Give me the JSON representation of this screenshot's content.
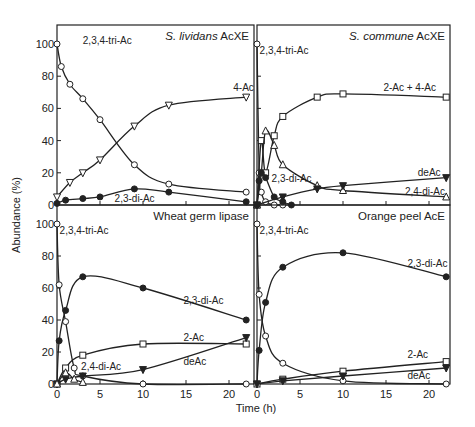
{
  "figure": {
    "ylabel": "Abundance (%)",
    "xlabel": "Time (h)"
  },
  "chart_data": [
    {
      "type": "line",
      "title": "S. lividans AcXE",
      "title_italic": "S. lividans",
      "title_rest": " AcXE",
      "xlabel": "Time (h)",
      "ylabel": "Abundance (%)",
      "xlim": [
        0,
        23
      ],
      "ylim": [
        0,
        105
      ],
      "yticks": [
        0,
        20,
        40,
        60,
        80,
        100
      ],
      "series": [
        {
          "name": "2,3,4-tri-Ac",
          "marker": "circle-open",
          "x": [
            0,
            0.5,
            1.5,
            3,
            5,
            9,
            13,
            22
          ],
          "y": [
            100,
            86,
            75,
            66,
            53,
            25,
            13,
            8
          ]
        },
        {
          "name": "4-Ac",
          "marker": "triangle-down-open",
          "x": [
            0,
            1.5,
            3,
            5,
            9,
            13,
            22
          ],
          "y": [
            5,
            14,
            20,
            28,
            49,
            62,
            67
          ]
        },
        {
          "name": "2,3-di-Ac",
          "marker": "circle-filled",
          "x": [
            0,
            1,
            3,
            5,
            9,
            13,
            22
          ],
          "y": [
            1,
            3,
            4,
            5,
            10,
            8,
            2
          ]
        }
      ]
    },
    {
      "type": "line",
      "title": "S. commune AcXE",
      "title_italic": "S. commune",
      "title_rest": " AcXE",
      "xlim": [
        0,
        23
      ],
      "ylim": [
        0,
        105
      ],
      "series": [
        {
          "name": "2,3,4-tri-Ac",
          "marker": "circle-open",
          "x": [
            0,
            0.25,
            0.5,
            1,
            2,
            3
          ],
          "y": [
            100,
            20,
            8,
            2,
            0,
            0
          ]
        },
        {
          "name": "2-Ac + 4-Ac",
          "marker": "square-open",
          "x": [
            0,
            0.5,
            1,
            2,
            3,
            7,
            10,
            22
          ],
          "y": [
            0,
            40,
            20,
            43,
            55,
            67,
            69,
            67
          ]
        },
        {
          "name": "2,4-di-Ac",
          "marker": "triangle-up-open",
          "x": [
            0,
            0.5,
            1,
            2,
            3,
            7,
            10,
            22
          ],
          "y": [
            0,
            20,
            46,
            37,
            25,
            12,
            9,
            5
          ]
        },
        {
          "name": "deAc",
          "marker": "triangle-down-filled",
          "x": [
            0,
            3,
            7,
            10,
            22
          ],
          "y": [
            0,
            5,
            10,
            12,
            17
          ]
        },
        {
          "name": "2,3-di-Ac",
          "marker": "circle-filled",
          "x": [
            0,
            0.25,
            0.5,
            1,
            2,
            3,
            4
          ],
          "y": [
            0,
            15,
            20,
            17,
            5,
            2,
            0
          ]
        }
      ]
    },
    {
      "type": "line",
      "title": "Wheat germ lipase",
      "title_italic": "",
      "title_rest": "Wheat germ lipase",
      "xticks": [
        0,
        5,
        10,
        15,
        20
      ],
      "xlim": [
        0,
        23
      ],
      "ylim": [
        0,
        105
      ],
      "yticks": [
        0,
        20,
        40,
        60,
        80,
        100
      ],
      "series": [
        {
          "name": "2,3,4-tri-Ac",
          "marker": "circle-open",
          "x": [
            0,
            0.25,
            1,
            2,
            3,
            10,
            22
          ],
          "y": [
            100,
            62,
            39,
            10,
            5,
            0,
            0
          ]
        },
        {
          "name": "2,3-di-Ac",
          "marker": "circle-filled",
          "x": [
            0,
            0.25,
            1,
            3,
            10,
            22
          ],
          "y": [
            0,
            27,
            46,
            67,
            60,
            40
          ]
        },
        {
          "name": "2-Ac",
          "marker": "square-open",
          "x": [
            0,
            1,
            3,
            10,
            22
          ],
          "y": [
            0,
            10,
            18,
            25,
            25
          ]
        },
        {
          "name": "deAc",
          "marker": "triangle-down-filled",
          "x": [
            0,
            1,
            3,
            10,
            22
          ],
          "y": [
            0,
            3,
            5,
            9,
            29
          ]
        },
        {
          "name": "2,4-di-Ac",
          "marker": "triangle-up-open",
          "x": [
            0,
            1,
            2,
            3
          ],
          "y": [
            0,
            7,
            3,
            1
          ]
        }
      ]
    },
    {
      "type": "line",
      "title": "Orange peel AcE",
      "title_italic": "",
      "title_rest": "Orange peel AcE",
      "xticks": [
        0,
        5,
        10,
        15,
        20
      ],
      "xlim": [
        0,
        23
      ],
      "ylim": [
        0,
        105
      ],
      "series": [
        {
          "name": "2,3,4-tri-Ac",
          "marker": "circle-open",
          "x": [
            0,
            0.25,
            1,
            3,
            10,
            22
          ],
          "y": [
            100,
            56,
            30,
            13,
            2,
            0
          ]
        },
        {
          "name": "2,3-di-Ac",
          "marker": "circle-filled",
          "x": [
            0,
            0.25,
            1,
            3,
            10,
            22
          ],
          "y": [
            0,
            21,
            51,
            73,
            82,
            67
          ]
        },
        {
          "name": "2-Ac",
          "marker": "square-open",
          "x": [
            0,
            3,
            10,
            22
          ],
          "y": [
            0,
            3,
            8,
            14
          ]
        },
        {
          "name": "deAc",
          "marker": "triangle-down-filled",
          "x": [
            0,
            3,
            10,
            22
          ],
          "y": [
            0,
            2,
            5,
            10
          ]
        }
      ]
    }
  ],
  "labels": {
    "p0": [
      {
        "text": "2,3,4-tri-Ac",
        "x": 3,
        "y": 100
      },
      {
        "text": "4-Ac",
        "x": 20.5,
        "y": 71
      },
      {
        "text": "2,3-di-Ac",
        "x": 6.7,
        "y": 2
      }
    ],
    "p1": [
      {
        "text": "2,3,4-tri-Ac",
        "x": 0.3,
        "y": 94
      },
      {
        "text": "2-Ac + 4-Ac",
        "x": 14.7,
        "y": 71
      },
      {
        "text": "deAc",
        "x": 18.7,
        "y": 18
      },
      {
        "text": "2,4-di-Ac",
        "x": 17.2,
        "y": 6
      },
      {
        "text": "2,3-di-Ac",
        "x": 1.7,
        "y": 14
      }
    ],
    "p2": [
      {
        "text": "2,3,4-tri-Ac",
        "x": 0.3,
        "y": 94
      },
      {
        "text": "2,3-di-Ac",
        "x": 14.7,
        "y": 50
      },
      {
        "text": "2-Ac",
        "x": 14.7,
        "y": 27
      },
      {
        "text": "deAc",
        "x": 14.7,
        "y": 12
      },
      {
        "text": "2,4-di-Ac",
        "x": 2.8,
        "y": 9
      }
    ],
    "p3": [
      {
        "text": "2,3,4-tri-Ac",
        "x": 0.3,
        "y": 94
      },
      {
        "text": "2,3-di-Ac",
        "x": 17.5,
        "y": 73
      },
      {
        "text": "2-Ac",
        "x": 17.5,
        "y": 16
      },
      {
        "text": "deAc",
        "x": 17.5,
        "y": 3
      }
    ]
  }
}
